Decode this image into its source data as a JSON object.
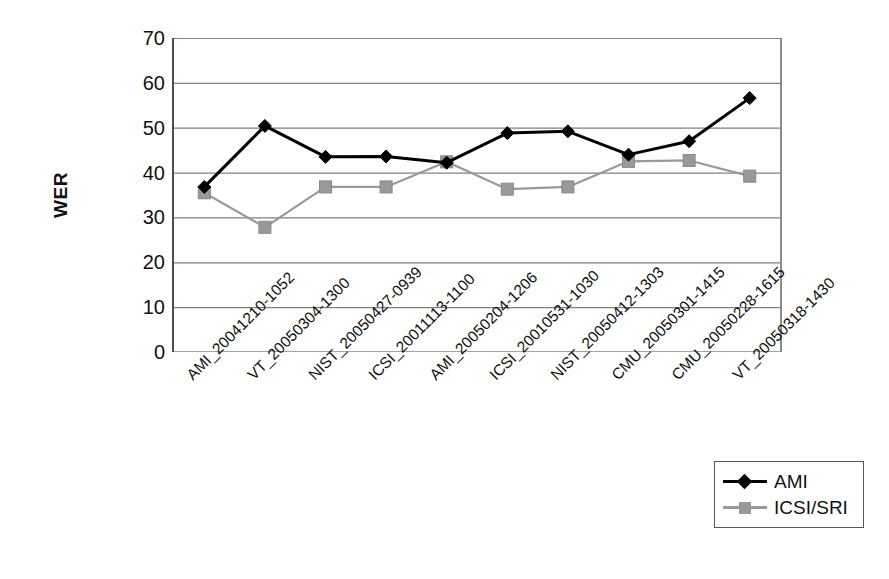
{
  "chart_data": {
    "type": "line",
    "title": "",
    "xlabel": "",
    "ylabel": "WER",
    "ylim": [
      0,
      70
    ],
    "ytick_step": 10,
    "yticks": [
      70,
      60,
      50,
      40,
      30,
      20,
      10,
      0
    ],
    "grid": true,
    "legend_position": "bottom-right",
    "categories": [
      "AMI_20041210-1052",
      "VT_20050304-1300",
      "NIST_20050427-0939",
      "ICSI_20011113-1100",
      "AMI_20050204-1206",
      "ICSI_20010531-1030",
      "NIST_20050412-1303",
      "CMU_20050301-1415",
      "CMU_20050228-1615",
      "VT_20050318-1430"
    ],
    "series": [
      {
        "name": "AMI",
        "color": "#000000",
        "marker": "diamond",
        "values": [
          36.8,
          50.4,
          43.5,
          43.6,
          42.2,
          48.8,
          49.2,
          44.0,
          47.0,
          56.6
        ]
      },
      {
        "name": "ICSI/SRI",
        "color": "#999999",
        "marker": "square",
        "values": [
          35.5,
          27.8,
          36.8,
          36.8,
          42.4,
          36.3,
          36.8,
          42.5,
          42.7,
          39.2
        ]
      }
    ]
  },
  "legend": {
    "entries": [
      {
        "label": "AMI"
      },
      {
        "label": "ICSI/SRI"
      }
    ]
  },
  "colors": {
    "series_ami": "#000000",
    "series_icsi_sri": "#999999",
    "gridline": "#808080",
    "axis": "#4d4d4d",
    "background": "#ffffff"
  }
}
